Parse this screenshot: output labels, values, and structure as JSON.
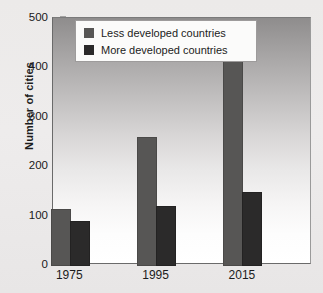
{
  "chart_data": {
    "type": "bar",
    "title": "",
    "xlabel": "",
    "ylabel": "Number of cities",
    "categories": [
      "1975",
      "1995",
      "2015"
    ],
    "series": [
      {
        "name": "Less developed countries",
        "color": "#575655",
        "values": [
          112,
          258,
          435
        ]
      },
      {
        "name": "More developed countries",
        "color": "#2b2a2a",
        "values": [
          88,
          118,
          145
        ]
      }
    ],
    "ylim": [
      0,
      500
    ],
    "yticks": [
      0,
      100,
      200,
      300,
      400,
      500
    ],
    "ytick_labels": [
      "0",
      "100",
      "200",
      "300",
      "400",
      "500"
    ],
    "grid": false,
    "legend_position": "top-left-inside"
  },
  "legend": {
    "items": [
      {
        "label": "Less developed countries",
        "color": "#575655"
      },
      {
        "label": "More developed countries",
        "color": "#2b2a2a"
      }
    ]
  },
  "axes": {
    "y_title": "Number of cities"
  }
}
